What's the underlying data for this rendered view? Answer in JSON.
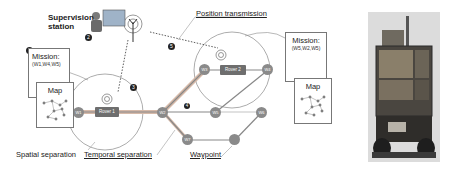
{
  "supervision_station": {
    "label_line1": "Supervision",
    "label_line2": "station",
    "badge": "2"
  },
  "labels": {
    "position_transmission": "Position transmission",
    "spatial_separation": "Spatial separation",
    "temporal_separation": "Temporal separation",
    "waypoint": "Waypoint"
  },
  "missions": [
    {
      "title": "Mission:",
      "waypoints": "(W1,W4,W5)",
      "badge": "1"
    },
    {
      "title": "Mission:",
      "waypoints": "(W5,W2,W5)"
    }
  ],
  "maps": [
    {
      "title": "Map"
    },
    {
      "title": "Map"
    }
  ],
  "rovers": [
    {
      "label": "Rover 1",
      "badge": "3"
    },
    {
      "label": "Rover 2"
    }
  ],
  "waypoints": [
    "W1",
    "W2",
    "W3",
    "W4",
    "W5",
    "W6",
    "W7"
  ],
  "badges": {
    "transmission": "5",
    "edge": "4"
  },
  "colors": {
    "waypoint": "#8a8a8a",
    "rover": "#6e6e6e",
    "edge": "#9a9a9a",
    "badge": "#222222"
  },
  "photo": {
    "description": "rover-robot-photo"
  }
}
